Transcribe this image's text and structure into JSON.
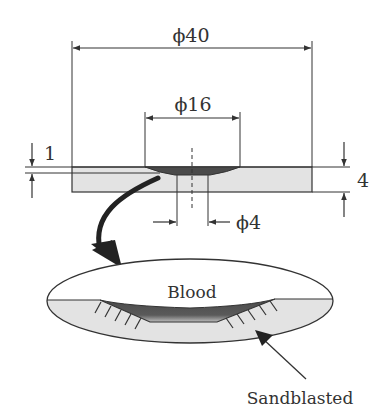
{
  "diagram": {
    "type": "engineering-cross-section",
    "dimensions": {
      "outer_diameter": "ϕ40",
      "recess_diameter": "ϕ16",
      "hole_diameter": "ϕ4",
      "film_thickness": "1",
      "plate_thickness": "4"
    },
    "detail_view": {
      "top_label": "Blood",
      "callout_label": "Sandblasted"
    },
    "colors": {
      "line": "#333333",
      "plate_fill": "#e3e3e3",
      "recess_fill": "#555555",
      "background": "#ffffff"
    }
  }
}
